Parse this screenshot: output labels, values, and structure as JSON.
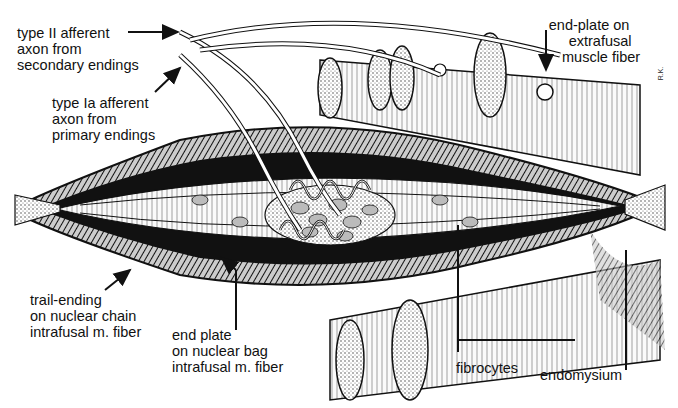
{
  "figure": {
    "artist_initials": "R.K."
  },
  "labels": {
    "type_ii_afferent": [
      "type II afferent",
      "axon from",
      "secondary endings"
    ],
    "type_ia_afferent": [
      "type Ia afferent",
      "axon from",
      "primary endings"
    ],
    "end_plate_extrafusal": [
      "end-plate on",
      "extrafusal",
      "muscle fiber"
    ],
    "trail_ending": [
      "trail-ending",
      "on nuclear chain",
      "intrafusal m. fiber"
    ],
    "end_plate_nuclear_bag": [
      "end plate",
      "on nuclear bag",
      "intrafusal m. fiber"
    ],
    "fibrocytes": [
      "fibrocytes"
    ],
    "endomysium": [
      "endomysium"
    ]
  },
  "colors": {
    "ink": "#111111",
    "background": "#ffffff",
    "stipple": "#8a8a8a",
    "light_fill": "#e8e8e8"
  }
}
